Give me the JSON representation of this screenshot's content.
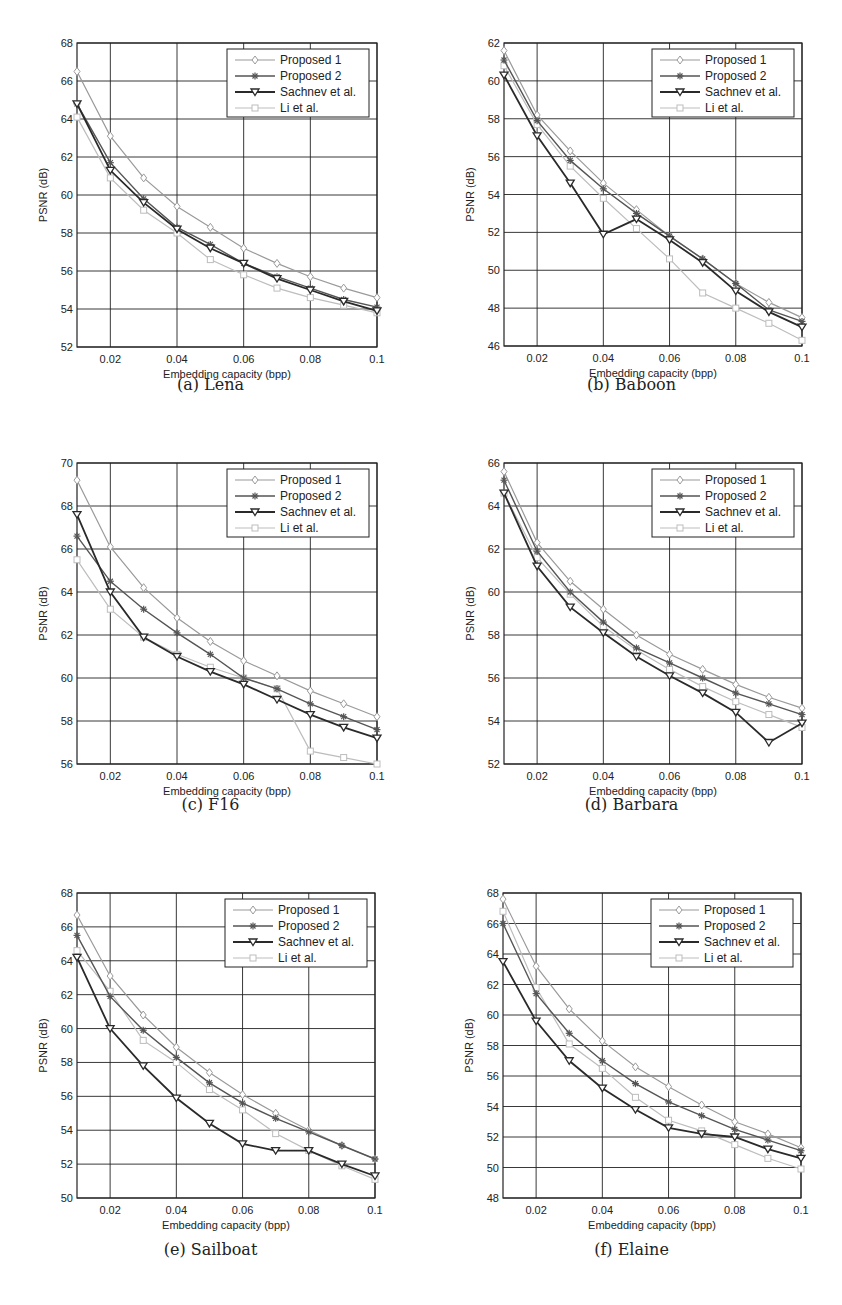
{
  "figure": {
    "x_label": "Embedding capacity (bpp)",
    "y_label": "PSNR (dB)",
    "x_ticks": [
      0.02,
      0.04,
      0.06,
      0.08,
      0.1
    ],
    "x_tick_labels": [
      "0.02",
      "0.04",
      "0.06",
      "0.08",
      "0.1"
    ],
    "legend": [
      "Proposed 1",
      "Proposed 2",
      "Sachnev et al.",
      "Li et al."
    ],
    "series_styles": {
      "Proposed 1": {
        "color": "#9a9a9a",
        "marker": "diamond",
        "width": 1.2
      },
      "Proposed 2": {
        "color": "#555555",
        "marker": "star",
        "width": 1.4
      },
      "Sachnev et al.": {
        "color": "#2a2a2a",
        "marker": "triangle-down",
        "width": 1.8
      },
      "Li et al.": {
        "color": "#bdbdbd",
        "marker": "square",
        "width": 1.2
      }
    }
  },
  "chart_data": [
    {
      "type": "line",
      "title": "(a) Lena",
      "xlabel": "Embedding capacity (bpp)",
      "ylabel": "PSNR (dB)",
      "x": [
        0.01,
        0.02,
        0.03,
        0.04,
        0.05,
        0.06,
        0.07,
        0.08,
        0.09,
        0.1
      ],
      "ylim": [
        52,
        68
      ],
      "yticks": [
        52,
        54,
        56,
        58,
        60,
        62,
        64,
        66,
        68
      ],
      "grid": true,
      "legend_position": "upper right",
      "series": [
        {
          "name": "Proposed 1",
          "values": [
            66.5,
            63.1,
            60.9,
            59.4,
            58.3,
            57.2,
            56.4,
            55.7,
            55.1,
            54.6
          ]
        },
        {
          "name": "Proposed 2",
          "values": [
            64.8,
            61.7,
            59.8,
            58.3,
            57.4,
            56.4,
            55.7,
            55.1,
            54.5,
            54.1
          ]
        },
        {
          "name": "Sachnev et al.",
          "values": [
            64.8,
            61.3,
            59.6,
            58.2,
            57.2,
            56.4,
            55.6,
            55.0,
            54.4,
            53.9
          ]
        },
        {
          "name": "Li et al.",
          "values": [
            64.1,
            60.9,
            59.2,
            58.0,
            56.6,
            55.8,
            55.1,
            54.6,
            54.2,
            53.8
          ]
        }
      ]
    },
    {
      "type": "line",
      "title": "(b) Baboon",
      "xlabel": "Embedding capacity (bpp)",
      "ylabel": "PSNR (dB)",
      "x": [
        0.01,
        0.02,
        0.03,
        0.04,
        0.05,
        0.06,
        0.07,
        0.08,
        0.09,
        0.1
      ],
      "ylim": [
        46,
        62
      ],
      "yticks": [
        46,
        48,
        50,
        52,
        54,
        56,
        58,
        60,
        62
      ],
      "grid": true,
      "legend_position": "upper right",
      "series": [
        {
          "name": "Proposed 1",
          "values": [
            61.6,
            58.2,
            56.3,
            54.6,
            53.2,
            51.8,
            50.6,
            49.3,
            48.3,
            47.5
          ]
        },
        {
          "name": "Proposed 2",
          "values": [
            61.1,
            57.9,
            55.8,
            54.3,
            53.0,
            51.8,
            50.6,
            49.3,
            47.9,
            47.3
          ]
        },
        {
          "name": "Sachnev et al.",
          "values": [
            60.3,
            57.1,
            54.6,
            51.9,
            52.7,
            51.6,
            50.4,
            48.9,
            47.8,
            47.0
          ]
        },
        {
          "name": "Li et al.",
          "values": [
            60.8,
            57.7,
            55.5,
            53.8,
            52.2,
            50.6,
            48.8,
            48.0,
            47.2,
            46.3
          ]
        }
      ]
    },
    {
      "type": "line",
      "title": "(c) F16",
      "xlabel": "Embedding capacity (bpp)",
      "ylabel": "PSNR (dB)",
      "x": [
        0.01,
        0.02,
        0.03,
        0.04,
        0.05,
        0.06,
        0.07,
        0.08,
        0.09,
        0.1
      ],
      "ylim": [
        56,
        70
      ],
      "yticks": [
        56,
        58,
        60,
        62,
        64,
        66,
        68,
        70
      ],
      "grid": true,
      "legend_position": "upper right",
      "series": [
        {
          "name": "Proposed 1",
          "values": [
            69.2,
            66.1,
            64.2,
            62.8,
            61.7,
            60.8,
            60.1,
            59.4,
            58.8,
            58.2
          ]
        },
        {
          "name": "Proposed 2",
          "values": [
            66.6,
            64.5,
            63.2,
            62.1,
            61.1,
            60.0,
            59.5,
            58.8,
            58.2,
            57.6
          ]
        },
        {
          "name": "Sachnev et al.",
          "values": [
            67.6,
            64.0,
            61.9,
            61.0,
            60.3,
            59.7,
            59.0,
            58.3,
            57.7,
            57.2
          ]
        },
        {
          "name": "Li et al.",
          "values": [
            65.5,
            63.2,
            61.9,
            61.1,
            60.5,
            60.0,
            59.5,
            56.6,
            56.3,
            56.0
          ]
        }
      ]
    },
    {
      "type": "line",
      "title": "(d) Barbara",
      "xlabel": "Embedding capacity (bpp)",
      "ylabel": "PSNR (dB)",
      "x": [
        0.01,
        0.02,
        0.03,
        0.04,
        0.05,
        0.06,
        0.07,
        0.08,
        0.09,
        0.1
      ],
      "ylim": [
        52,
        66
      ],
      "yticks": [
        52,
        54,
        56,
        58,
        60,
        62,
        64,
        66
      ],
      "grid": true,
      "legend_position": "upper right",
      "series": [
        {
          "name": "Proposed 1",
          "values": [
            65.6,
            62.3,
            60.5,
            59.2,
            58.0,
            57.1,
            56.4,
            55.7,
            55.1,
            54.6
          ]
        },
        {
          "name": "Proposed 2",
          "values": [
            65.2,
            61.9,
            60.0,
            58.6,
            57.4,
            56.7,
            56.0,
            55.3,
            54.8,
            54.3
          ]
        },
        {
          "name": "Sachnev et al.",
          "values": [
            64.6,
            61.2,
            59.3,
            58.1,
            57.0,
            56.1,
            55.3,
            54.4,
            53.0,
            53.9
          ]
        },
        {
          "name": "Li et al.",
          "values": [
            64.6,
            61.6,
            59.9,
            58.4,
            57.3,
            56.4,
            55.6,
            54.9,
            54.3,
            53.7
          ]
        }
      ]
    },
    {
      "type": "line",
      "title": "(e) Sailboat",
      "xlabel": "Embedding capacity (bpp)",
      "ylabel": "PSNR (dB)",
      "x": [
        0.01,
        0.02,
        0.03,
        0.04,
        0.05,
        0.06,
        0.07,
        0.08,
        0.09,
        0.1
      ],
      "ylim": [
        50,
        68
      ],
      "yticks": [
        50,
        52,
        54,
        56,
        58,
        60,
        62,
        64,
        66,
        68
      ],
      "grid": true,
      "legend_position": "upper right",
      "series": [
        {
          "name": "Proposed 1",
          "values": [
            66.7,
            63.1,
            60.8,
            58.9,
            57.4,
            56.1,
            55.0,
            54.0,
            53.1,
            52.3
          ]
        },
        {
          "name": "Proposed 2",
          "values": [
            65.5,
            61.9,
            59.9,
            58.3,
            56.8,
            55.6,
            54.7,
            53.9,
            53.1,
            52.3
          ]
        },
        {
          "name": "Sachnev et al.",
          "values": [
            64.2,
            60.0,
            57.8,
            55.9,
            54.4,
            53.2,
            52.8,
            52.8,
            52.0,
            51.3
          ]
        },
        {
          "name": "Li et al.",
          "values": [
            64.6,
            62.2,
            59.3,
            58.0,
            56.4,
            55.2,
            53.8,
            52.8,
            51.9,
            51.1
          ]
        }
      ]
    },
    {
      "type": "line",
      "title": "(f) Elaine",
      "xlabel": "Embedding capacity (bpp)",
      "ylabel": "PSNR (dB)",
      "x": [
        0.01,
        0.02,
        0.03,
        0.04,
        0.05,
        0.06,
        0.07,
        0.08,
        0.09,
        0.1
      ],
      "ylim": [
        48,
        68
      ],
      "yticks": [
        48,
        50,
        52,
        54,
        56,
        58,
        60,
        62,
        64,
        66,
        68
      ],
      "grid": true,
      "legend_position": "upper right",
      "series": [
        {
          "name": "Proposed 1",
          "values": [
            67.6,
            63.2,
            60.4,
            58.3,
            56.6,
            55.3,
            54.1,
            53.0,
            52.2,
            51.3
          ]
        },
        {
          "name": "Proposed 2",
          "values": [
            66.0,
            61.4,
            58.8,
            57.0,
            55.5,
            54.3,
            53.4,
            52.5,
            51.8,
            51.1
          ]
        },
        {
          "name": "Sachnev et al.",
          "values": [
            63.5,
            59.6,
            57.0,
            55.2,
            53.8,
            52.6,
            52.2,
            52.0,
            51.2,
            50.6
          ]
        },
        {
          "name": "Li et al.",
          "values": [
            66.8,
            61.8,
            58.1,
            56.5,
            54.6,
            53.1,
            52.4,
            51.5,
            50.6,
            49.9
          ]
        }
      ]
    }
  ]
}
